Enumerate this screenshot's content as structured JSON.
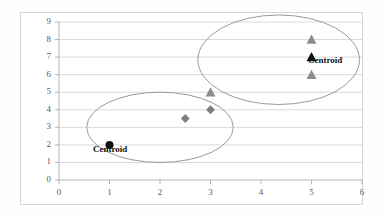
{
  "chart_data": {
    "type": "scatter",
    "title": "",
    "xlabel": "",
    "ylabel": "",
    "xlim": [
      0,
      6
    ],
    "ylim": [
      0,
      9
    ],
    "xticks": [
      "0",
      "1",
      "2",
      "3",
      "4",
      "5",
      "6"
    ],
    "yticks": [
      "0",
      "1",
      "2",
      "3",
      "4",
      "5",
      "6",
      "7",
      "8",
      "9"
    ],
    "grid": "horizontal",
    "legend": "none",
    "series": [
      {
        "name": "cluster-1-points",
        "marker": "diamond",
        "color": "#808080",
        "points": [
          {
            "x": 2.5,
            "y": 3.5
          },
          {
            "x": 3,
            "y": 4
          }
        ]
      },
      {
        "name": "cluster-2-points",
        "marker": "triangle",
        "color": "#8c8c8c",
        "points": [
          {
            "x": 3,
            "y": 5
          },
          {
            "x": 5,
            "y": 8
          },
          {
            "x": 5,
            "y": 6
          }
        ]
      },
      {
        "name": "cluster-1-centroid",
        "marker": "circle",
        "color": "#111111",
        "points": [
          {
            "x": 1,
            "y": 2,
            "label": "Centroid"
          }
        ]
      },
      {
        "name": "cluster-2-centroid",
        "marker": "triangle",
        "color": "#111111",
        "points": [
          {
            "x": 5,
            "y": 7,
            "label": "Centroid"
          }
        ]
      }
    ],
    "annotations": [
      {
        "text": "Centroid",
        "x": 1,
        "y": 2
      },
      {
        "text": "Centroid",
        "x": 5,
        "y": 7
      }
    ],
    "ellipses": [
      {
        "name": "cluster-1-ellipse",
        "cx": 2.0,
        "cy": 3.0,
        "rx": 1.45,
        "ry": 2.0,
        "color": "#9a9a9a"
      },
      {
        "name": "cluster-2-ellipse",
        "cx": 4.35,
        "cy": 6.85,
        "rx": 1.6,
        "ry": 2.55,
        "color": "#9a9a9a"
      }
    ]
  },
  "axes": {
    "x_ticks": [
      "0",
      "1",
      "2",
      "3",
      "4",
      "5",
      "6"
    ],
    "y_ticks": [
      "0",
      "1",
      "2",
      "3",
      "4",
      "5",
      "6",
      "7",
      "8",
      "9"
    ]
  },
  "labels": {
    "centroid_left": "Centroid",
    "centroid_right": "Centroid"
  },
  "colors": {
    "marker_gray": "#808080",
    "marker_black": "#111111",
    "ellipse": "#9a9a9a",
    "grid": "#d9d9d9",
    "axis": "#b5b5b5",
    "frame": "#d6d6d6"
  }
}
